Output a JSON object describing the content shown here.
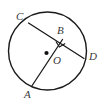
{
  "figure": {
    "type": "circle-geometry-diagram",
    "canvas": {
      "width": 105,
      "height": 105,
      "background": "#ffffff"
    },
    "colors": {
      "stroke": "#1a1a1a",
      "label_text": "#3a3a3a",
      "center_dot": "#111111",
      "background": "#ffffff"
    },
    "circle": {
      "name": "main-circle",
      "center_x": 47.5,
      "center_y": 51,
      "radius": 39,
      "stroke_width": 1.4
    },
    "center_point": {
      "name": "center-point-O",
      "x": 46.5,
      "y": 53,
      "dot_radius": 2.1
    },
    "points": {
      "A": {
        "x": 31.5,
        "y": 86.5
      },
      "B": {
        "x": 62.5,
        "y": 39.5
      },
      "C": {
        "x": 28.5,
        "y": 23.0
      },
      "D": {
        "x": 84.0,
        "y": 58.5
      },
      "O": {
        "x": 46.5,
        "y": 53.0
      }
    },
    "segments": [
      {
        "name": "chord-CD",
        "from": "C",
        "to": "D",
        "stroke_width": 1.3
      },
      {
        "name": "segment-AB-through-O",
        "from": "A",
        "to": "B",
        "stroke_width": 1.3
      }
    ],
    "right_angle_marker": {
      "name": "right-angle-marker-at-B",
      "at_point": "B",
      "size": 8,
      "stroke_width": 1.2,
      "angle_value": "90",
      "note": "square marker indicating AB is perpendicular to chord CD at B"
    },
    "labels": [
      {
        "name": "label-C",
        "text": "C",
        "x": 16,
        "y": 11
      },
      {
        "name": "label-B",
        "text": "B",
        "x": 57,
        "y": 25
      },
      {
        "name": "label-D",
        "text": "D",
        "x": 89,
        "y": 51
      },
      {
        "name": "label-O",
        "text": "O",
        "x": 53,
        "y": 55
      },
      {
        "name": "label-A",
        "text": "A",
        "x": 24,
        "y": 89
      }
    ]
  }
}
